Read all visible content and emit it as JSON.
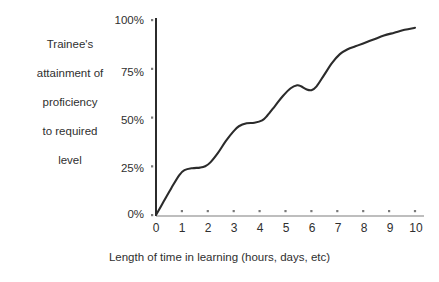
{
  "chart_data": {
    "type": "line",
    "title": "",
    "subtitle": "",
    "xlabel": "Length of time in learning (hours, days, etc)",
    "ylabel": "Trainee's attainment of proficiency to required level",
    "ylabel_lines": [
      "Trainee's",
      "attainment of",
      "proficiency",
      "to required",
      "level"
    ],
    "xlim": [
      0,
      10
    ],
    "ylim": [
      0,
      100
    ],
    "grid": false,
    "legend": null,
    "xticks": [
      "0",
      "1",
      "2",
      "3",
      "4",
      "5",
      "6",
      "7",
      "8",
      "9",
      "10"
    ],
    "xtick_values": [
      0,
      1,
      2,
      3,
      4,
      5,
      6,
      7,
      8,
      9,
      10
    ],
    "yticks": [
      "0%",
      "25%",
      "50%",
      "75%",
      "100%"
    ],
    "ytick_values": [
      0,
      25,
      50,
      75,
      100
    ],
    "series": [
      {
        "name": "Learning curve",
        "color": "#2b2b2b",
        "x": [
          0.0,
          0.3,
          0.6,
          0.9,
          1.1,
          1.4,
          1.7,
          1.9,
          2.1,
          2.4,
          2.7,
          3.0,
          3.2,
          3.5,
          3.8,
          4.1,
          4.3,
          4.6,
          4.9,
          5.2,
          5.45,
          5.6,
          5.8,
          6.0,
          6.2,
          6.5,
          6.8,
          7.1,
          7.4,
          7.7,
          8.0,
          8.4,
          8.8,
          9.2,
          9.6,
          10.0
        ],
        "y": [
          0.0,
          7.0,
          14.0,
          20.5,
          23.0,
          24.0,
          24.3,
          25.0,
          27.0,
          32.0,
          38.0,
          43.0,
          45.5,
          47.0,
          47.3,
          48.5,
          51.0,
          56.0,
          61.0,
          65.0,
          66.5,
          66.0,
          64.5,
          64.0,
          66.0,
          72.0,
          78.0,
          82.5,
          85.0,
          86.5,
          88.0,
          90.0,
          92.0,
          93.5,
          95.0,
          96.0
        ]
      }
    ],
    "annotations": [
      {
        "text": "plateau 1",
        "x_range": [
          1.0,
          1.9
        ],
        "y": 24
      },
      {
        "text": "plateau 2",
        "x_range": [
          3.3,
          4.2
        ],
        "y": 47
      },
      {
        "text": "dip",
        "x_range": [
          5.5,
          6.1
        ],
        "y": 65
      }
    ],
    "colors": {
      "curve": "#2b2b2b",
      "y_axis": "#2b2b2b",
      "x_axis": "#9a9a9a",
      "tick_dot": "#7a7a7a",
      "text": "#2f2f2f",
      "background": "#ffffff"
    },
    "geometry": {
      "origin_x": 156,
      "origin_y": 215,
      "plot_right_x": 415,
      "plot_top_y": 20
    }
  }
}
